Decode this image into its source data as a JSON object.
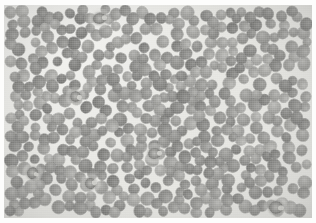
{
  "figure": {
    "kind": "light-microscopy-photomicrograph",
    "title": "",
    "caption": "",
    "width_px": 316,
    "height_px": 223,
    "color_mode": "grayscale",
    "border": {
      "present": true,
      "color": "#fdfdfc",
      "left_px": 4,
      "right_px": 4,
      "top_px": 5,
      "bottom_px": 5
    },
    "palette": {
      "background_plasma": "#e9e9e6",
      "background_highlight": "#f2f2ef",
      "erythrocyte_mid": "#959592",
      "erythrocyte_rim": "#8b8b88",
      "erythrocyte_center": "#a9a9a6",
      "leukocyte_nucleus_dark": "#1a1a18",
      "leukocyte_nucleus_mid": "#333331"
    },
    "content_notes": {
      "dominant_cells": "erythrocytes",
      "erythrocyte_count_visible": "approximately 420",
      "erythrocyte_diameter_px": "9 to 13",
      "leukocyte_count_visible": "6",
      "leukocyte_diameter_px": "9 to 15"
    }
  },
  "leukocytes": [
    {
      "label": "wbc-1",
      "x": 95,
      "y": 13,
      "w": 13,
      "h": 11,
      "rot": -8
    },
    {
      "label": "wbc-2",
      "x": 71,
      "y": 91,
      "w": 11,
      "h": 11,
      "rot": 14
    },
    {
      "label": "wbc-3",
      "x": 150,
      "y": 148,
      "w": 13,
      "h": 11,
      "rot": -4
    },
    {
      "label": "wbc-4",
      "x": 28,
      "y": 168,
      "w": 11,
      "h": 12,
      "rot": 20
    },
    {
      "label": "wbc-5",
      "x": 86,
      "y": 178,
      "w": 11,
      "h": 11,
      "rot": -12
    },
    {
      "label": "wbc-6",
      "x": 272,
      "y": 202,
      "w": 14,
      "h": 13,
      "rot": 6
    }
  ],
  "overlay": {
    "annotations": [],
    "scale_bar": null,
    "labels": []
  }
}
